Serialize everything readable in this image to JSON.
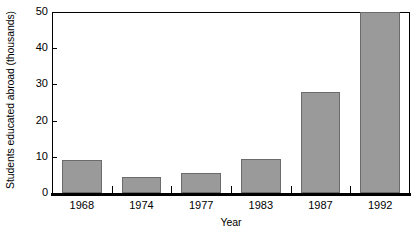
{
  "chart_data": {
    "type": "bar",
    "title": "",
    "subtitle": "",
    "categories": [
      "1968",
      "1974",
      "1977",
      "1983",
      "1987",
      "1992"
    ],
    "values": [
      9,
      4.5,
      5.5,
      9.5,
      28,
      50
    ],
    "xlabel": "Year",
    "ylabel": "Students educated abroad (thousands)",
    "ylim": [
      0,
      50
    ],
    "yticks": [
      0,
      10,
      20,
      30,
      40,
      50
    ],
    "ytick_labels": [
      "0",
      "10",
      "20",
      "30",
      "40",
      "50"
    ],
    "grid": false,
    "legend": false,
    "legend_position": "none",
    "bar_color": "#9a9a9a",
    "bar_edge_color": "#6b6b6b",
    "axis_color": "#000000",
    "background_color": "#ffffff",
    "annotations": []
  }
}
